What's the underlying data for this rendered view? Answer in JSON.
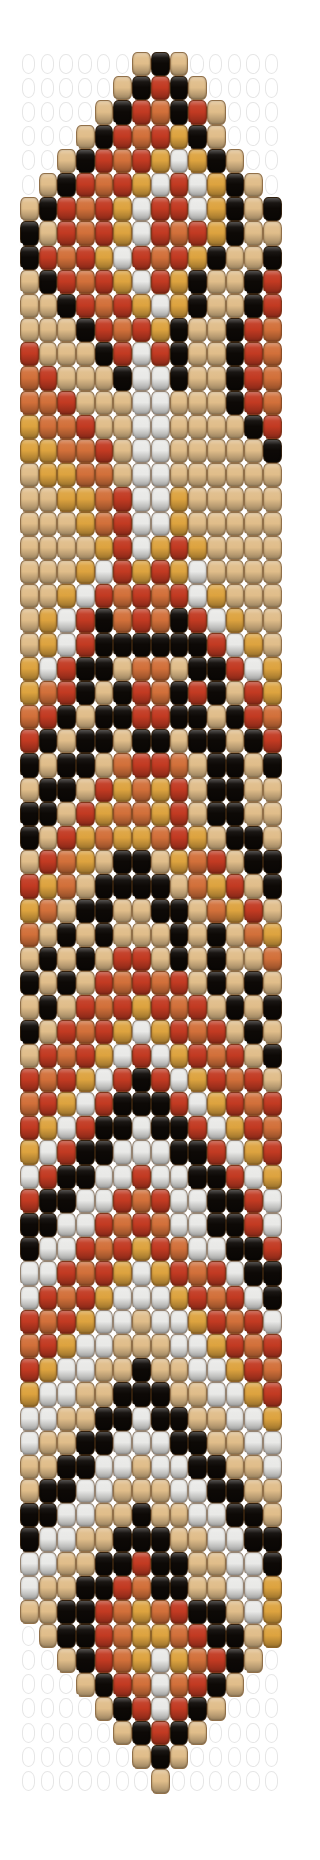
{
  "document": {
    "type": "bead-loom-pattern-chart",
    "title": "Beaded Bracelet Pattern",
    "background_color": "#ffffff",
    "canvas": {
      "width": 301,
      "height": 1860
    }
  },
  "grid": {
    "columns": 14,
    "rows": 72,
    "bead_width_px": 18.7,
    "bead_height_px": 24.2,
    "origin_x_px": 20,
    "origin_y_px": 52
  },
  "palette": {
    "legend": [
      {
        "key": "K",
        "name": "black",
        "hex": "#0d0906"
      },
      {
        "key": "R",
        "name": "red",
        "hex": "#c23a22"
      },
      {
        "key": "O",
        "name": "orange",
        "hex": "#d2703a"
      },
      {
        "key": "G",
        "name": "gold",
        "hex": "#dda33f"
      },
      {
        "key": "T",
        "name": "tan",
        "hex": "#e0bd8a"
      },
      {
        "key": "W",
        "name": "white",
        "hex": "#e9e9e7"
      },
      {
        "key": ".",
        "name": "empty",
        "hex": "transparent"
      }
    ],
    "black": "#0d0906",
    "red": "#c23a22",
    "orange": "#d2703a",
    "gold": "#dda33f",
    "tan": "#e0bd8a",
    "white": "#e9e9e7",
    "empty": "transparent",
    "empty_outline": "#e6e6e6",
    "thread_dot": "#fdfdfd"
  },
  "chart_data": {
    "type": "heatmap",
    "xlabel": "",
    "ylabel": "",
    "columns": 14,
    "rows": 72,
    "legend_position": "none",
    "grid": false,
    "color_keys": [
      "K",
      "R",
      "O",
      "G",
      "T",
      "W",
      "."
    ],
    "cells": [
      "......TKT.....",
      ".....TKRKT....",
      "....TKROKRT...",
      "...TKRORGKT...",
      "..TKRORGWGKT..",
      ".TKRORGWRWGKT.",
      "TKRORGWRRWGKTK",
      "KTRORGWRORGKTT",
      "KRORGWRORGKTTK",
      "TKRORGWRGKTTKR",
      "TTKRORGWGKTTKR",
      "TTTKRORGKTTKRO",
      "RTTTKRWRKTTKRO",
      "ORTTTKWWKTTKRO",
      "OORTTTWWTTTKRO",
      "GOORTTWWTTTTKR",
      "GGOORTWWTTTTTK",
      "TGGOOTWWTTTTTT",
      "TTGGORWWGTTTTT",
      "TTTGORWWGTTTTT",
      "TTTTGRWGRGTTTT",
      "TTTGWRGRGWTTTT",
      "TTGWRORORWGTTT",
      "TGWRKOROKRWGTT",
      "TGWRKKKKKKRWGT",
      "GWRKKTOOTKKRWG",
      "GORKTKROKRKTRG",
      "ORKTKKRRKKTKRO",
      "RKTKKTKKTKKTKR",
      "KTKKTORROTKKTK",
      "TKKTRGOGRTKKTT",
      "KKTRGOOGRTKKTT",
      "KTRGOGGORGTKKT",
      "TROGTKKTGORTKK",
      "RGOTKKKKTOGRTK",
      "GOTKKTTKKTOGRT",
      "OTKTKTTTKTKTOG",
      "TKTKTRRTKTKTTO",
      "KTKTRORORTKTKT",
      "TKTRORGRORTKTK",
      "KTRORGWGRORTKT",
      "TRORGWRWGRORTK",
      "RORGWRKRWGRORT",
      "ORGWRKKKRWGROR",
      "RGWRKKWKKRWGRO",
      "GWRKKWWWKKRWGR",
      "WRKKWWRWWKKRWG",
      "RKKWWRORWWKKRW",
      "KKWWROROWWKKRW",
      "KWWRORGROWWKKR",
      "WWRORGWGRORWKK",
      "WRORGWWWGRORWK",
      "RORGWWTWWGRORW",
      "ORGWWTTTWWGROR",
      "RGWWTTKTTWWGRO",
      "GWWTTKKKTTWWGR",
      "WWTTKKWKKTTWWG",
      "WTTKKWWWKKTTWW",
      "TTKKWWTWWKKTTW",
      "TKKWWTTTWWKKTT",
      "KKWWTTKTTWWKKT",
      "KWWTTKKKTTWWKK",
      "WWTTKKRKKTTWWK",
      "WTTKKROKKTTWWG",
      "TTKKROGORKKTWG",
      ".TKKROGGORKKTG",
      "..TKROGWGORKT.",
      "...TKROWORKT..",
      "....TKRWRKT...",
      ".....TKRKT....",
      "......TKT.....",
      ".......T......"
    ]
  }
}
